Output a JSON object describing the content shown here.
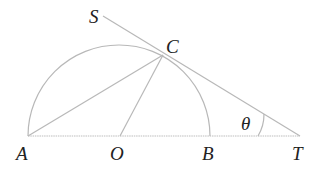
{
  "diagram": {
    "type": "geometry",
    "colors": {
      "line": "#b8b8b8",
      "text": "#222222",
      "background": "#ffffff"
    },
    "points": {
      "A": {
        "label": "A",
        "x": 28,
        "y": 136
      },
      "O": {
        "label": "O",
        "x": 120,
        "y": 136
      },
      "B": {
        "label": "B",
        "x": 210,
        "y": 136
      },
      "T": {
        "label": "T",
        "x": 300,
        "y": 136
      },
      "C": {
        "label": "C",
        "x": 163,
        "y": 55
      },
      "S": {
        "label": "S",
        "x": 103,
        "y": 16
      }
    },
    "angle_label": "θ",
    "segments": [
      "A-T",
      "A-C",
      "O-C",
      "S-T"
    ],
    "arcs": [
      "semicircle A-B center O"
    ]
  }
}
